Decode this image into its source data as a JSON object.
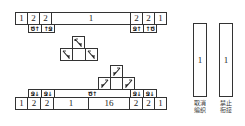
{
  "diagram": {
    "top_row": {
      "cells": [
        "1",
        "2",
        "2",
        "1",
        "2",
        "2",
        "1"
      ]
    },
    "top_symbols": {
      "left": [
        "Ծ↑",
        "↑Ջ"
      ],
      "right": [
        "Ջ↑",
        "↑Ծ"
      ]
    },
    "pyramid_left": {
      "top": "ℕ",
      "bottom": [
        "ℕ",
        "",
        "ℕ"
      ]
    },
    "pyramid_right": {
      "top": "ℤ",
      "bottom": [
        "ℤ",
        "",
        "ℤ"
      ]
    },
    "bottom_symbols": {
      "left": [
        "Ջ↓",
        "Ջ↓"
      ],
      "middle": "Ծ↑",
      "right": [
        "Ջ↓",
        "Ջ↓"
      ]
    },
    "bottom_row": {
      "cells": [
        "1",
        "2",
        "2",
        "1",
        "16",
        "2",
        "2",
        "1"
      ]
    },
    "legend": [
      {
        "value": "1",
        "label_line1": "取消",
        "label_line2": "编织"
      },
      {
        "value": "1",
        "label_line1": "禁止",
        "label_line2": "衔接"
      }
    ]
  }
}
